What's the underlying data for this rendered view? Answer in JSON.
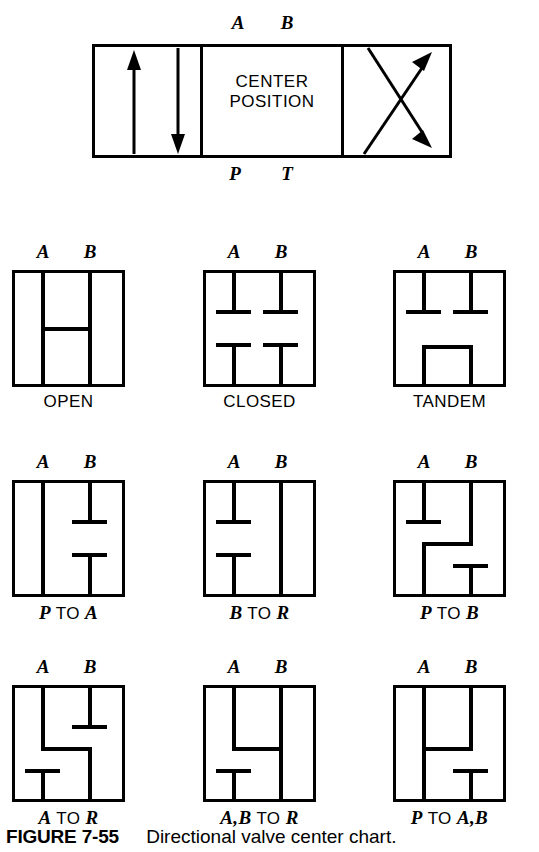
{
  "figure": {
    "number_label": "FIGURE 7-55",
    "caption_text": "Directional valve center chart."
  },
  "banner": {
    "center_line1": "CENTER",
    "center_line2": "POSITION",
    "top_labels": [
      "A",
      "B"
    ],
    "bottom_labels": [
      "P",
      "T"
    ],
    "left_cell": "parallel-arrows-up-down",
    "right_cell": "crossed-arrows"
  },
  "ports": {
    "top_a": "A",
    "top_b": "B"
  },
  "cells": [
    {
      "id": "open",
      "caption": "OPEN",
      "row": 1,
      "col": 1
    },
    {
      "id": "closed",
      "caption": "CLOSED",
      "row": 1,
      "col": 2
    },
    {
      "id": "tandem",
      "caption": "TANDEM",
      "row": 1,
      "col": 3
    },
    {
      "id": "p-to-a",
      "caption_parts": [
        "P",
        " TO ",
        "A"
      ],
      "row": 2,
      "col": 1
    },
    {
      "id": "b-to-r",
      "caption_parts": [
        "B",
        " TO ",
        "R"
      ],
      "row": 2,
      "col": 2
    },
    {
      "id": "p-to-b",
      "caption_parts": [
        "P",
        " TO ",
        "B"
      ],
      "row": 2,
      "col": 3
    },
    {
      "id": "a-to-r",
      "caption_parts": [
        "A",
        " TO ",
        "R"
      ],
      "row": 3,
      "col": 1
    },
    {
      "id": "ab-to-r",
      "caption_parts": [
        "A,B",
        " TO ",
        "R"
      ],
      "row": 3,
      "col": 2
    },
    {
      "id": "p-to-ab",
      "caption_parts": [
        "P",
        " TO ",
        "A,B"
      ],
      "row": 3,
      "col": 3
    }
  ],
  "captions": {
    "open": "OPEN",
    "closed": "CLOSED",
    "tandem": "TANDEM",
    "p_to_a_1": "P",
    "p_to_a_2": " TO ",
    "p_to_a_3": "A",
    "b_to_r_1": "B",
    "b_to_r_2": " TO ",
    "b_to_r_3": "R",
    "p_to_b_1": "P",
    "p_to_b_2": " TO ",
    "p_to_b_3": "B",
    "a_to_r_1": "A",
    "a_to_r_2": " TO ",
    "a_to_r_3": "R",
    "ab_to_r_1": "A,B",
    "ab_to_r_2": " TO ",
    "ab_to_r_3": "R",
    "p_to_ab_1": "P",
    "p_to_ab_2": " TO ",
    "p_to_ab_3": "A,B"
  },
  "colors": {
    "line": "#000000",
    "background": "#ffffff"
  }
}
